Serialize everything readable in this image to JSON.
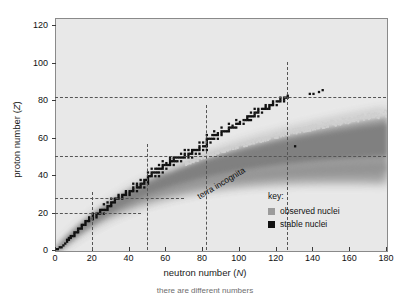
{
  "figure": {
    "caption": "there are different numbers"
  },
  "axes": {
    "x": {
      "title_text": "neutron number (",
      "title_symbol": "N",
      "title_close": ")",
      "ticks": [
        0,
        20,
        40,
        60,
        80,
        100,
        120,
        140,
        160,
        180
      ],
      "min": 0,
      "max": 180
    },
    "y": {
      "title_text": "proton number (",
      "title_symbol": "Z",
      "title_close": ")",
      "ticks": [
        0,
        20,
        40,
        60,
        80,
        100,
        120
      ],
      "min": 0,
      "max": 124
    }
  },
  "annotations": {
    "terra_incognita": "terra incognita"
  },
  "legend": {
    "title": "key:",
    "entries": [
      {
        "label": "observed nuclei",
        "color": "#9b9b9b"
      },
      {
        "label": "stable nuclei",
        "color": "#111111"
      }
    ]
  },
  "magic_numbers": {
    "neutron": [
      20,
      50,
      82,
      126
    ],
    "proton": [
      20,
      28,
      50,
      82
    ]
  },
  "colors": {
    "plot_background": "#e8e8e8",
    "observed": "#9b9b9b",
    "stable": "#111111",
    "guide_line": "#555555",
    "frame": "#8a8a8a"
  },
  "chart_data": {
    "type": "scatter",
    "title": "",
    "xlabel": "neutron number (N)",
    "ylabel": "proton number (Z)",
    "xlim": [
      0,
      180
    ],
    "ylim": [
      0,
      124
    ],
    "xticks": [
      0,
      20,
      40,
      60,
      80,
      100,
      120,
      140,
      160,
      180
    ],
    "yticks": [
      0,
      20,
      40,
      60,
      80,
      100,
      120
    ],
    "grid": false,
    "legend_position": "lower right",
    "series": [
      {
        "name": "observed nuclei",
        "color": "#9b9b9b",
        "description": "Broad band of experimentally observed (mostly radioactive) nuclides spanning from the proton drip line to the neutron drip line, widening with increasing mass.",
        "drip_line_proton_rich": [
          [
            0,
            1
          ],
          [
            2,
            3
          ],
          [
            4,
            6
          ],
          [
            7,
            9
          ],
          [
            10,
            13
          ],
          [
            14,
            17
          ],
          [
            19,
            22
          ],
          [
            24,
            28
          ],
          [
            30,
            34
          ],
          [
            37,
            41
          ],
          [
            44,
            48
          ],
          [
            52,
            56
          ],
          [
            60,
            64
          ],
          [
            68,
            72
          ],
          [
            77,
            81
          ],
          [
            86,
            90
          ],
          [
            96,
            100
          ],
          [
            106,
            110
          ],
          [
            116,
            118
          ]
        ],
        "drip_line_neutron_rich": [
          [
            2,
            1
          ],
          [
            8,
            3
          ],
          [
            14,
            5
          ],
          [
            20,
            8
          ],
          [
            28,
            11
          ],
          [
            36,
            14
          ],
          [
            44,
            17
          ],
          [
            54,
            21
          ],
          [
            64,
            25
          ],
          [
            74,
            29
          ],
          [
            86,
            34
          ],
          [
            98,
            39
          ],
          [
            110,
            45
          ],
          [
            122,
            51
          ],
          [
            134,
            58
          ],
          [
            146,
            66
          ],
          [
            158,
            75
          ],
          [
            168,
            86
          ],
          [
            176,
            100
          ]
        ]
      },
      {
        "name": "stable nuclei",
        "color": "#111111",
        "description": "Narrow staircase of stable isotopes (the valley of stability) running from N=0,Z=1 up to roughly N=126,Z=83.",
        "points": [
          [
            0,
            1
          ],
          [
            1,
            1
          ],
          [
            2,
            2
          ],
          [
            3,
            2
          ],
          [
            4,
            3
          ],
          [
            5,
            4
          ],
          [
            6,
            5
          ],
          [
            6,
            6
          ],
          [
            7,
            6
          ],
          [
            7,
            7
          ],
          [
            8,
            7
          ],
          [
            8,
            8
          ],
          [
            9,
            8
          ],
          [
            10,
            8
          ],
          [
            10,
            9
          ],
          [
            10,
            10
          ],
          [
            11,
            10
          ],
          [
            12,
            10
          ],
          [
            12,
            11
          ],
          [
            12,
            12
          ],
          [
            13,
            12
          ],
          [
            14,
            12
          ],
          [
            14,
            13
          ],
          [
            14,
            14
          ],
          [
            15,
            14
          ],
          [
            16,
            14
          ],
          [
            16,
            15
          ],
          [
            16,
            16
          ],
          [
            17,
            16
          ],
          [
            18,
            16
          ],
          [
            18,
            17
          ],
          [
            20,
            17
          ],
          [
            18,
            18
          ],
          [
            20,
            18
          ],
          [
            22,
            18
          ],
          [
            20,
            19
          ],
          [
            22,
            19
          ],
          [
            20,
            20
          ],
          [
            22,
            20
          ],
          [
            23,
            20
          ],
          [
            24,
            20
          ],
          [
            26,
            20
          ],
          [
            24,
            21
          ],
          [
            24,
            22
          ],
          [
            25,
            22
          ],
          [
            26,
            22
          ],
          [
            27,
            22
          ],
          [
            28,
            22
          ],
          [
            28,
            23
          ],
          [
            28,
            24
          ],
          [
            29,
            24
          ],
          [
            30,
            24
          ],
          [
            26,
            25
          ],
          [
            30,
            25
          ],
          [
            28,
            26
          ],
          [
            30,
            26
          ],
          [
            31,
            26
          ],
          [
            32,
            26
          ],
          [
            32,
            27
          ],
          [
            30,
            28
          ],
          [
            32,
            28
          ],
          [
            33,
            28
          ],
          [
            34,
            28
          ],
          [
            36,
            28
          ],
          [
            34,
            29
          ],
          [
            36,
            29
          ],
          [
            34,
            30
          ],
          [
            36,
            30
          ],
          [
            37,
            30
          ],
          [
            38,
            30
          ],
          [
            40,
            30
          ],
          [
            38,
            31
          ],
          [
            40,
            31
          ],
          [
            38,
            32
          ],
          [
            40,
            32
          ],
          [
            41,
            32
          ],
          [
            42,
            32
          ],
          [
            44,
            32
          ],
          [
            42,
            33
          ],
          [
            42,
            34
          ],
          [
            44,
            34
          ],
          [
            45,
            34
          ],
          [
            46,
            34
          ],
          [
            48,
            34
          ],
          [
            44,
            35
          ],
          [
            46,
            35
          ],
          [
            42,
            36
          ],
          [
            44,
            36
          ],
          [
            46,
            36
          ],
          [
            47,
            36
          ],
          [
            48,
            36
          ],
          [
            50,
            36
          ],
          [
            48,
            37
          ],
          [
            50,
            37
          ],
          [
            46,
            38
          ],
          [
            48,
            38
          ],
          [
            49,
            38
          ],
          [
            50,
            38
          ],
          [
            50,
            39
          ],
          [
            50,
            40
          ],
          [
            51,
            40
          ],
          [
            52,
            40
          ],
          [
            54,
            40
          ],
          [
            56,
            40
          ],
          [
            52,
            41
          ],
          [
            50,
            42
          ],
          [
            52,
            42
          ],
          [
            53,
            42
          ],
          [
            54,
            42
          ],
          [
            55,
            42
          ],
          [
            56,
            42
          ],
          [
            58,
            42
          ],
          [
            52,
            44
          ],
          [
            54,
            44
          ],
          [
            55,
            44
          ],
          [
            56,
            44
          ],
          [
            57,
            44
          ],
          [
            58,
            44
          ],
          [
            60,
            44
          ],
          [
            58,
            45
          ],
          [
            56,
            46
          ],
          [
            58,
            46
          ],
          [
            59,
            46
          ],
          [
            60,
            46
          ],
          [
            61,
            46
          ],
          [
            62,
            46
          ],
          [
            64,
            46
          ],
          [
            60,
            47
          ],
          [
            62,
            47
          ],
          [
            58,
            48
          ],
          [
            62,
            48
          ],
          [
            63,
            48
          ],
          [
            64,
            48
          ],
          [
            65,
            48
          ],
          [
            66,
            48
          ],
          [
            68,
            48
          ],
          [
            62,
            49
          ],
          [
            64,
            49
          ],
          [
            62,
            50
          ],
          [
            64,
            50
          ],
          [
            65,
            50
          ],
          [
            66,
            50
          ],
          [
            67,
            50
          ],
          [
            68,
            50
          ],
          [
            69,
            50
          ],
          [
            70,
            50
          ],
          [
            72,
            50
          ],
          [
            74,
            50
          ],
          [
            70,
            51
          ],
          [
            72,
            51
          ],
          [
            68,
            52
          ],
          [
            70,
            52
          ],
          [
            72,
            52
          ],
          [
            73,
            52
          ],
          [
            74,
            52
          ],
          [
            76,
            52
          ],
          [
            78,
            52
          ],
          [
            74,
            53
          ],
          [
            70,
            54
          ],
          [
            72,
            54
          ],
          [
            74,
            54
          ],
          [
            75,
            54
          ],
          [
            76,
            54
          ],
          [
            77,
            54
          ],
          [
            78,
            54
          ],
          [
            80,
            54
          ],
          [
            82,
            54
          ],
          [
            78,
            55
          ],
          [
            78,
            56
          ],
          [
            80,
            56
          ],
          [
            81,
            56
          ],
          [
            82,
            56
          ],
          [
            130,
            56
          ],
          [
            82,
            57
          ],
          [
            82,
            58
          ],
          [
            80,
            58
          ],
          [
            78,
            58
          ],
          [
            84,
            58
          ],
          [
            82,
            59
          ],
          [
            82,
            60
          ],
          [
            83,
            60
          ],
          [
            84,
            60
          ],
          [
            85,
            60
          ],
          [
            86,
            60
          ],
          [
            88,
            60
          ],
          [
            82,
            62
          ],
          [
            85,
            62
          ],
          [
            86,
            62
          ],
          [
            87,
            62
          ],
          [
            88,
            62
          ],
          [
            90,
            62
          ],
          [
            88,
            63
          ],
          [
            90,
            63
          ],
          [
            86,
            64
          ],
          [
            90,
            64
          ],
          [
            91,
            64
          ],
          [
            92,
            64
          ],
          [
            93,
            64
          ],
          [
            94,
            64
          ],
          [
            94,
            65
          ],
          [
            90,
            66
          ],
          [
            94,
            66
          ],
          [
            95,
            66
          ],
          [
            96,
            66
          ],
          [
            97,
            66
          ],
          [
            98,
            66
          ],
          [
            96,
            67
          ],
          [
            94,
            68
          ],
          [
            98,
            68
          ],
          [
            99,
            68
          ],
          [
            100,
            68
          ],
          [
            102,
            68
          ],
          [
            100,
            69
          ],
          [
            98,
            70
          ],
          [
            102,
            70
          ],
          [
            103,
            70
          ],
          [
            104,
            70
          ],
          [
            105,
            70
          ],
          [
            106,
            70
          ],
          [
            104,
            71
          ],
          [
            104,
            72
          ],
          [
            105,
            72
          ],
          [
            106,
            72
          ],
          [
            107,
            72
          ],
          [
            108,
            72
          ],
          [
            110,
            72
          ],
          [
            108,
            73
          ],
          [
            106,
            74
          ],
          [
            108,
            74
          ],
          [
            109,
            74
          ],
          [
            110,
            74
          ],
          [
            112,
            74
          ],
          [
            110,
            75
          ],
          [
            108,
            76
          ],
          [
            110,
            76
          ],
          [
            112,
            76
          ],
          [
            113,
            76
          ],
          [
            114,
            76
          ],
          [
            115,
            76
          ],
          [
            116,
            76
          ],
          [
            114,
            77
          ],
          [
            116,
            77
          ],
          [
            114,
            78
          ],
          [
            116,
            78
          ],
          [
            117,
            78
          ],
          [
            118,
            78
          ],
          [
            120,
            78
          ],
          [
            118,
            79
          ],
          [
            118,
            80
          ],
          [
            120,
            80
          ],
          [
            121,
            80
          ],
          [
            122,
            80
          ],
          [
            124,
            80
          ],
          [
            122,
            81
          ],
          [
            124,
            81
          ],
          [
            122,
            82
          ],
          [
            124,
            82
          ],
          [
            125,
            82
          ],
          [
            126,
            82
          ],
          [
            126,
            83
          ]
        ]
      }
    ]
  }
}
